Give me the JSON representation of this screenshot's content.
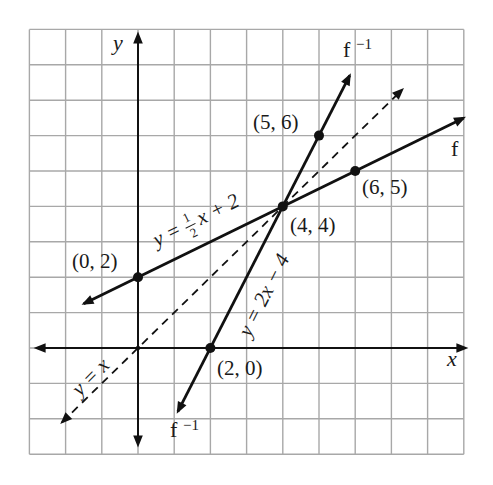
{
  "chart_data": {
    "type": "line",
    "title": "",
    "xlabel": "x",
    "ylabel": "y",
    "xlim": [
      -3,
      9
    ],
    "ylim": [
      -3,
      9
    ],
    "grid": true,
    "series": [
      {
        "name": "f",
        "equation": "y = 1/2 x + 2",
        "style": "solid",
        "x": [
          -1.5,
          9
        ],
        "y": [
          1.25,
          6.5
        ]
      },
      {
        "name": "f^-1",
        "equation": "y = 2x - 4",
        "style": "solid",
        "x": [
          1.1,
          5.85
        ],
        "y": [
          -1.8,
          7.7
        ]
      },
      {
        "name": "y = x",
        "equation": "y = x",
        "style": "dashed",
        "x": [
          -2.1,
          7.3
        ],
        "y": [
          -2.1,
          7.3
        ]
      }
    ],
    "points": [
      {
        "label": "(0, 2)",
        "x": 0,
        "y": 2
      },
      {
        "label": "(2, 0)",
        "x": 2,
        "y": 0
      },
      {
        "label": "(4, 4)",
        "x": 4,
        "y": 4
      },
      {
        "label": "(5, 6)",
        "x": 5,
        "y": 6
      },
      {
        "label": "(6, 5)",
        "x": 6,
        "y": 5
      }
    ],
    "annotations": [
      "f",
      "f^-1",
      "f^-1",
      "y = 1/2 x + 2",
      "y = 2x - 4",
      "y = x"
    ]
  },
  "labels": {
    "x_axis": "x",
    "y_axis": "y",
    "f": "f",
    "finv_base": "f",
    "finv_exp": "−1",
    "eq_f_lhs": "y = ",
    "eq_f_num": "1",
    "eq_f_den": "2",
    "eq_f_rhs": "x + 2",
    "eq_finv": "y = 2x − 4",
    "eq_identity": "y = x",
    "pt_0_2": "(0, 2)",
    "pt_2_0": "(2, 0)",
    "pt_4_4": "(4, 4)",
    "pt_5_6": "(5, 6)",
    "pt_6_5": "(6, 5)"
  }
}
